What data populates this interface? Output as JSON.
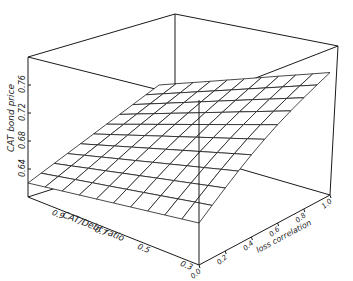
{
  "chart_data": {
    "type": "surface3d",
    "title": "",
    "zlabel": "CAT bond price",
    "xlabel": "CAT/Debt ratio",
    "ylabel": "loss correlation",
    "z_ticks": [
      "0.64",
      "0.68",
      "0.72",
      "0.76"
    ],
    "x_ticks": [
      "0.9",
      "0.7",
      "0.5",
      "0.3"
    ],
    "y_ticks": [
      "0.0",
      "0.2",
      "0.4",
      "0.6",
      "0.8",
      "1.0"
    ],
    "zlim": [
      0.6,
      0.8
    ],
    "x_range": [
      1.0,
      0.2
    ],
    "y_range": [
      0.0,
      1.0
    ],
    "grid_size": [
      11,
      11
    ],
    "corner_values": {
      "ratio_0.9_corr_0.0": 0.62,
      "ratio_0.9_corr_1.0": 0.66,
      "ratio_0.2_corr_0.0": 0.66,
      "ratio_0.2_corr_1.0": 0.775
    }
  }
}
